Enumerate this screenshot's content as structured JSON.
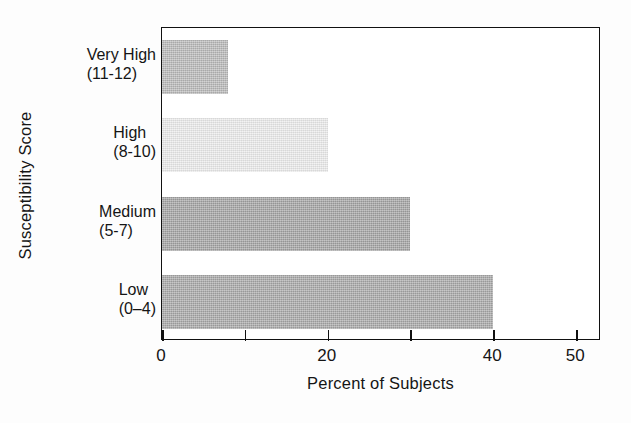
{
  "chart_data": {
    "type": "bar",
    "orientation": "horizontal",
    "title": "",
    "xlabel": "Percent of Subjects",
    "ylabel": "Susceptibility Score",
    "categories": [
      "Very High\n(11-12)",
      "High\n(8-10)",
      "Medium\n(5-7)",
      "Low\n(0–4)"
    ],
    "values": [
      8,
      20,
      30,
      40
    ],
    "xlim": [
      0,
      53
    ],
    "xticks": [
      0,
      10,
      20,
      30,
      40,
      50
    ],
    "xtick_labels": [
      "0",
      "",
      "20",
      "",
      "40",
      "50"
    ],
    "grid": false,
    "legend": false,
    "bar_colors": [
      "#b9b9b9",
      "#ececec",
      "#a3a3a3",
      "#a8a8a8"
    ]
  },
  "axes": {
    "y_title": "Susceptibility Score",
    "x_title": "Percent of Subjects"
  },
  "categories": [
    {
      "name": "Very High",
      "range": "(11-12)",
      "value": 8,
      "color": "#b9b9b9"
    },
    {
      "name": "High",
      "range": "(8-10)",
      "value": 20,
      "color": "#ececec"
    },
    {
      "name": "Medium",
      "range": "(5-7)",
      "value": 30,
      "color": "#a3a3a3"
    },
    {
      "name": "Low",
      "range": "(0–4)",
      "value": 40,
      "color": "#a8a8a8"
    }
  ],
  "xticks": [
    {
      "value": 0,
      "label": "0"
    },
    {
      "value": 10,
      "label": ""
    },
    {
      "value": 20,
      "label": "20"
    },
    {
      "value": 30,
      "label": ""
    },
    {
      "value": 40,
      "label": "40"
    },
    {
      "value": 50,
      "label": "50"
    }
  ],
  "colors": {
    "frame": "#111111",
    "text": "#151515",
    "background": "#ffffff"
  }
}
